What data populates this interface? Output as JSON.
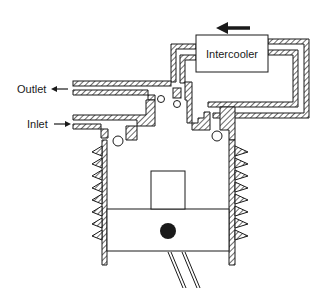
{
  "diagram": {
    "labels": {
      "intercooler": "Intercooler",
      "outlet": "Outlet",
      "inlet": "Inlet"
    },
    "flow_arrow_direction": "left",
    "icons": {
      "flow_arrow": "arrow-left-icon",
      "outlet_arrow": "arrow-left-icon",
      "inlet_arrow": "arrow-right-icon"
    },
    "colors": {
      "ink": "#1a1a1a",
      "background": "#ffffff"
    },
    "components": [
      "intercooler",
      "outlet-duct",
      "inlet-duct",
      "check-valves",
      "cylinder",
      "cooling-fins",
      "piston",
      "piston-pin",
      "connecting-rod"
    ]
  }
}
